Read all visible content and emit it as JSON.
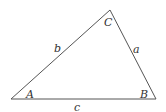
{
  "diagram": {
    "type": "triangle",
    "stroke_color": "#555555",
    "vertices": {
      "A": {
        "x": 11,
        "y": 99
      },
      "B": {
        "x": 156,
        "y": 99
      },
      "C": {
        "x": 110,
        "y": 10
      }
    },
    "labels": {
      "angle_A": "A",
      "angle_B": "B",
      "angle_C": "C",
      "side_a": "a",
      "side_b": "b",
      "side_c": "c"
    }
  }
}
